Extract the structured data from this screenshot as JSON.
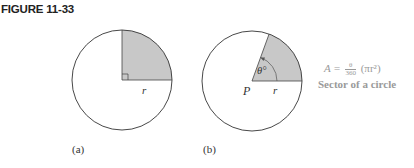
{
  "figure": {
    "title": "FIGURE 11-33"
  },
  "panels": [
    {
      "id": "a",
      "caption": "(a)",
      "circle": {
        "cx": 122,
        "cy": 80,
        "r": 50
      },
      "sector_angle_deg": 90,
      "radius_label": "r",
      "right_angle_marker": true
    },
    {
      "id": "b",
      "caption": "(b)",
      "circle": {
        "cx": 252,
        "cy": 81,
        "r": 50
      },
      "sector_angle_deg": 70,
      "radius_label": "r",
      "center_label": "P",
      "angle_label": "θ°"
    }
  ],
  "annotation": {
    "formula_lhs": "A =",
    "formula_num": "θ",
    "formula_den": "360",
    "formula_rhs": "(πr²)",
    "sector_label": "Sector of a circle"
  },
  "colors": {
    "sector_fill": "#c8c8c8",
    "outline": "#333333",
    "annotation_text": "#9a9a9a"
  }
}
